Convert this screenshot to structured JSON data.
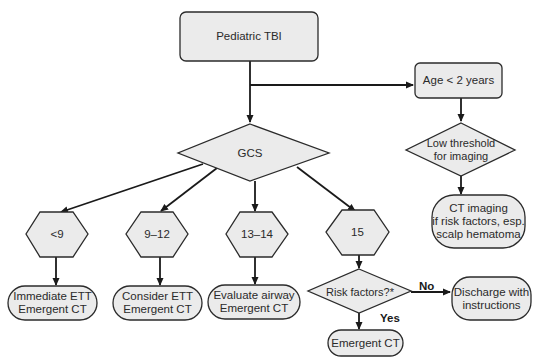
{
  "diagram": {
    "type": "flowchart",
    "colors": {
      "node_fill": "#ebebeb",
      "stroke": "#2b2b2b",
      "edge": "#1a1a1a",
      "text": "#2a2a2a"
    },
    "nodes": {
      "start": {
        "label": "Pediatric TBI",
        "shape": "rounded-rect"
      },
      "age": {
        "label": "Age < 2 years",
        "shape": "rounded-rect"
      },
      "low_threshold": {
        "label": "Low threshold\nfor imaging",
        "shape": "diamond"
      },
      "ct_imaging": {
        "label": "CT imaging\nif risk factors, esp.\nscalp hematoma",
        "shape": "terminal"
      },
      "gcs": {
        "label": "GCS",
        "shape": "diamond"
      },
      "gcs_lt9": {
        "label": "<9",
        "shape": "hexagon"
      },
      "gcs_9_12": {
        "label": "9–12",
        "shape": "hexagon"
      },
      "gcs_13_14": {
        "label": "13–14",
        "shape": "hexagon"
      },
      "gcs_15": {
        "label": "15",
        "shape": "hexagon"
      },
      "immediate_ett": {
        "label": "Immediate ETT\nEmergent CT",
        "shape": "terminal"
      },
      "consider_ett": {
        "label": "Consider ETT\nEmergent CT",
        "shape": "terminal"
      },
      "evaluate_airway": {
        "label": "Evaluate airway\nEmergent CT",
        "shape": "terminal"
      },
      "risk_factors": {
        "label": "Risk factors?*",
        "shape": "diamond"
      },
      "discharge": {
        "label": "Discharge with\ninstructions",
        "shape": "terminal"
      },
      "emergent_ct": {
        "label": "Emergent CT",
        "shape": "terminal"
      }
    },
    "edge_labels": {
      "no": "No",
      "yes": "Yes"
    },
    "edges": [
      [
        "start",
        "gcs"
      ],
      [
        "start",
        "age"
      ],
      [
        "age",
        "low_threshold"
      ],
      [
        "low_threshold",
        "ct_imaging"
      ],
      [
        "gcs",
        "gcs_lt9"
      ],
      [
        "gcs",
        "gcs_9_12"
      ],
      [
        "gcs",
        "gcs_13_14"
      ],
      [
        "gcs",
        "gcs_15"
      ],
      [
        "gcs_lt9",
        "immediate_ett"
      ],
      [
        "gcs_9_12",
        "consider_ett"
      ],
      [
        "gcs_13_14",
        "evaluate_airway"
      ],
      [
        "gcs_15",
        "risk_factors"
      ],
      [
        "risk_factors",
        "discharge",
        "No"
      ],
      [
        "risk_factors",
        "emergent_ct",
        "Yes"
      ]
    ]
  }
}
